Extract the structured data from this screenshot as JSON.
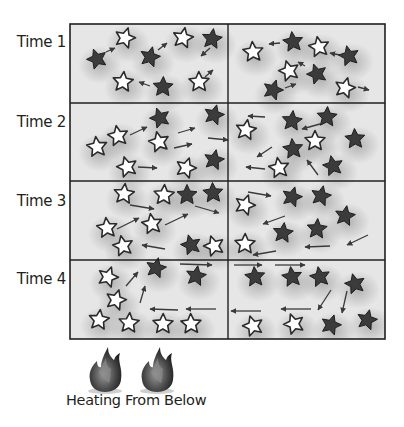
{
  "caption": "Heating From Below",
  "colors": {
    "cell_bg": "#e6e6e6",
    "cell_shadow": "#9a9a9a",
    "border": "#231f20",
    "hot_star": "#ffffff",
    "cold_star": "#3b3b3b",
    "arrow": "#3a3a3a",
    "text": "#231f20"
  },
  "grid": {
    "x": 70,
    "y": 24,
    "width": 315,
    "height": 315,
    "mid_x": 228,
    "row_ys": [
      24,
      103,
      181,
      260,
      339
    ]
  },
  "legend": {
    "white_star": "hot particle",
    "dark_star": "cold particle"
  },
  "heat_sources": [
    {
      "icon": "flame-icon",
      "x": 105,
      "y": 378
    },
    {
      "icon": "flame-icon",
      "x": 157,
      "y": 378
    }
  ],
  "rows": [
    {
      "label": "Time 1",
      "stars": [
        {
          "x": 97,
          "y": 59,
          "type": "cold"
        },
        {
          "x": 125,
          "y": 38,
          "type": "hot"
        },
        {
          "x": 150,
          "y": 57,
          "type": "cold"
        },
        {
          "x": 183,
          "y": 38,
          "type": "hot"
        },
        {
          "x": 212,
          "y": 39,
          "type": "cold"
        },
        {
          "x": 123,
          "y": 82,
          "type": "hot"
        },
        {
          "x": 163,
          "y": 87,
          "type": "cold"
        },
        {
          "x": 199,
          "y": 82,
          "type": "hot"
        },
        {
          "x": 253,
          "y": 52,
          "type": "hot"
        },
        {
          "x": 293,
          "y": 42,
          "type": "cold"
        },
        {
          "x": 319,
          "y": 47,
          "type": "hot"
        },
        {
          "x": 349,
          "y": 56,
          "type": "cold"
        },
        {
          "x": 289,
          "y": 71,
          "type": "hot"
        },
        {
          "x": 317,
          "y": 74,
          "type": "cold"
        },
        {
          "x": 273,
          "y": 90,
          "type": "cold"
        },
        {
          "x": 345,
          "y": 88,
          "type": "hot"
        }
      ],
      "arrows": [
        {
          "x1": 106,
          "y1": 52,
          "x2": 115,
          "y2": 48
        },
        {
          "x1": 158,
          "y1": 50,
          "x2": 167,
          "y2": 43
        },
        {
          "x1": 210,
          "y1": 48,
          "x2": 201,
          "y2": 56
        },
        {
          "x1": 150,
          "y1": 86,
          "x2": 139,
          "y2": 82
        },
        {
          "x1": 205,
          "y1": 77,
          "x2": 213,
          "y2": 70
        },
        {
          "x1": 280,
          "y1": 43,
          "x2": 269,
          "y2": 44
        },
        {
          "x1": 340,
          "y1": 55,
          "x2": 330,
          "y2": 53
        },
        {
          "x1": 305,
          "y1": 66,
          "x2": 298,
          "y2": 62
        },
        {
          "x1": 285,
          "y1": 88,
          "x2": 296,
          "y2": 84
        },
        {
          "x1": 358,
          "y1": 87,
          "x2": 369,
          "y2": 90
        }
      ]
    },
    {
      "label": "Time 2",
      "stars": [
        {
          "x": 97,
          "y": 147,
          "type": "hot"
        },
        {
          "x": 118,
          "y": 136,
          "type": "hot"
        },
        {
          "x": 159,
          "y": 142,
          "type": "hot"
        },
        {
          "x": 127,
          "y": 167,
          "type": "hot"
        },
        {
          "x": 160,
          "y": 118,
          "type": "cold"
        },
        {
          "x": 186,
          "y": 168,
          "type": "hot"
        },
        {
          "x": 214,
          "y": 115,
          "type": "cold"
        },
        {
          "x": 214,
          "y": 160,
          "type": "cold"
        },
        {
          "x": 246,
          "y": 130,
          "type": "hot"
        },
        {
          "x": 292,
          "y": 121,
          "type": "cold"
        },
        {
          "x": 327,
          "y": 117,
          "type": "cold"
        },
        {
          "x": 315,
          "y": 141,
          "type": "hot"
        },
        {
          "x": 355,
          "y": 139,
          "type": "cold"
        },
        {
          "x": 293,
          "y": 149,
          "type": "cold"
        },
        {
          "x": 279,
          "y": 168,
          "type": "hot"
        },
        {
          "x": 333,
          "y": 166,
          "type": "cold"
        }
      ],
      "arrows": [
        {
          "x1": 130,
          "y1": 135,
          "x2": 147,
          "y2": 127
        },
        {
          "x1": 178,
          "y1": 133,
          "x2": 195,
          "y2": 128
        },
        {
          "x1": 174,
          "y1": 148,
          "x2": 192,
          "y2": 144
        },
        {
          "x1": 208,
          "y1": 138,
          "x2": 228,
          "y2": 140
        },
        {
          "x1": 138,
          "y1": 167,
          "x2": 157,
          "y2": 168
        },
        {
          "x1": 265,
          "y1": 117,
          "x2": 248,
          "y2": 116
        },
        {
          "x1": 320,
          "y1": 124,
          "x2": 302,
          "y2": 129
        },
        {
          "x1": 272,
          "y1": 147,
          "x2": 257,
          "y2": 157
        },
        {
          "x1": 265,
          "y1": 169,
          "x2": 246,
          "y2": 167
        },
        {
          "x1": 318,
          "y1": 175,
          "x2": 307,
          "y2": 160
        }
      ]
    },
    {
      "label": "Time 3",
      "stars": [
        {
          "x": 124,
          "y": 194,
          "type": "hot"
        },
        {
          "x": 164,
          "y": 195,
          "type": "hot"
        },
        {
          "x": 187,
          "y": 195,
          "type": "cold"
        },
        {
          "x": 213,
          "y": 193,
          "type": "cold"
        },
        {
          "x": 107,
          "y": 228,
          "type": "hot"
        },
        {
          "x": 152,
          "y": 224,
          "type": "hot"
        },
        {
          "x": 123,
          "y": 246,
          "type": "hot"
        },
        {
          "x": 191,
          "y": 245,
          "type": "cold"
        },
        {
          "x": 214,
          "y": 246,
          "type": "hot"
        },
        {
          "x": 245,
          "y": 205,
          "type": "hot"
        },
        {
          "x": 292,
          "y": 197,
          "type": "cold"
        },
        {
          "x": 321,
          "y": 196,
          "type": "cold"
        },
        {
          "x": 345,
          "y": 216,
          "type": "cold"
        },
        {
          "x": 283,
          "y": 233,
          "type": "cold"
        },
        {
          "x": 317,
          "y": 229,
          "type": "cold"
        },
        {
          "x": 245,
          "y": 244,
          "type": "hot"
        }
      ],
      "arrows": [
        {
          "x1": 130,
          "y1": 205,
          "x2": 154,
          "y2": 209
        },
        {
          "x1": 117,
          "y1": 229,
          "x2": 139,
          "y2": 218
        },
        {
          "x1": 165,
          "y1": 225,
          "x2": 188,
          "y2": 214
        },
        {
          "x1": 195,
          "y1": 206,
          "x2": 219,
          "y2": 213
        },
        {
          "x1": 165,
          "y1": 249,
          "x2": 142,
          "y2": 245
        },
        {
          "x1": 248,
          "y1": 192,
          "x2": 271,
          "y2": 196
        },
        {
          "x1": 285,
          "y1": 216,
          "x2": 263,
          "y2": 224
        },
        {
          "x1": 330,
          "y1": 246,
          "x2": 305,
          "y2": 247
        },
        {
          "x1": 276,
          "y1": 251,
          "x2": 253,
          "y2": 255
        },
        {
          "x1": 368,
          "y1": 235,
          "x2": 347,
          "y2": 245
        }
      ]
    },
    {
      "label": "Time 4",
      "stars": [
        {
          "x": 108,
          "y": 277,
          "type": "hot"
        },
        {
          "x": 116,
          "y": 300,
          "type": "hot"
        },
        {
          "x": 156,
          "y": 268,
          "type": "cold"
        },
        {
          "x": 196,
          "y": 276,
          "type": "cold"
        },
        {
          "x": 99,
          "y": 320,
          "type": "hot"
        },
        {
          "x": 129,
          "y": 323,
          "type": "hot"
        },
        {
          "x": 163,
          "y": 324,
          "type": "hot"
        },
        {
          "x": 191,
          "y": 324,
          "type": "hot"
        },
        {
          "x": 255,
          "y": 277,
          "type": "cold"
        },
        {
          "x": 292,
          "y": 277,
          "type": "cold"
        },
        {
          "x": 320,
          "y": 277,
          "type": "cold"
        },
        {
          "x": 355,
          "y": 284,
          "type": "cold"
        },
        {
          "x": 253,
          "y": 326,
          "type": "hot"
        },
        {
          "x": 294,
          "y": 324,
          "type": "hot"
        },
        {
          "x": 331,
          "y": 325,
          "type": "cold"
        },
        {
          "x": 367,
          "y": 320,
          "type": "cold"
        }
      ],
      "arrows": [
        {
          "x1": 126,
          "y1": 286,
          "x2": 138,
          "y2": 272
        },
        {
          "x1": 140,
          "y1": 303,
          "x2": 145,
          "y2": 286
        },
        {
          "x1": 178,
          "y1": 310,
          "x2": 150,
          "y2": 309
        },
        {
          "x1": 216,
          "y1": 309,
          "x2": 186,
          "y2": 309
        },
        {
          "x1": 180,
          "y1": 264,
          "x2": 212,
          "y2": 265
        },
        {
          "x1": 234,
          "y1": 265,
          "x2": 262,
          "y2": 265
        },
        {
          "x1": 275,
          "y1": 265,
          "x2": 305,
          "y2": 265
        },
        {
          "x1": 331,
          "y1": 290,
          "x2": 318,
          "y2": 310
        },
        {
          "x1": 347,
          "y1": 291,
          "x2": 342,
          "y2": 313
        },
        {
          "x1": 261,
          "y1": 311,
          "x2": 231,
          "y2": 311
        },
        {
          "x1": 311,
          "y1": 309,
          "x2": 281,
          "y2": 309
        }
      ]
    }
  ]
}
